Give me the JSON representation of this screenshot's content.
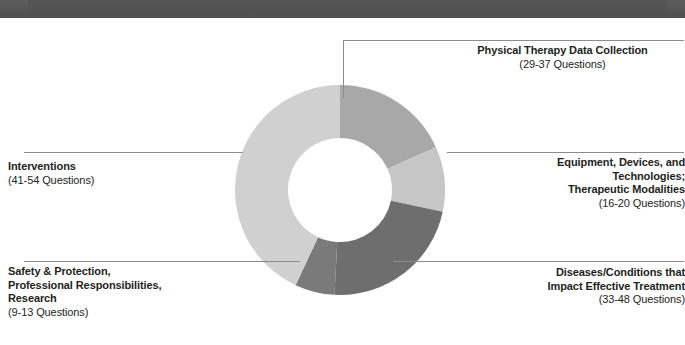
{
  "header": {
    "strip_color": "#555555"
  },
  "chart_data": {
    "type": "pie",
    "variant": "donut",
    "title": "",
    "center": {
      "x": 340,
      "y": 190
    },
    "outer_radius": 105,
    "inner_radius": 52,
    "start_angle_deg": 0,
    "direction": "clockwise",
    "units": "Questions",
    "categories": [
      "Physical Therapy Data Collection",
      "Equipment, Devices, and Technologies; Therapeutic Modalities",
      "Diseases/Conditions that Impact Effective Treatment",
      "Safety & Protection, Professional Responsibilities, Research",
      "Interventions"
    ],
    "values": [
      33,
      18,
      40.5,
      11,
      47.5
    ],
    "value_ranges": [
      [
        29,
        37
      ],
      [
        16,
        20
      ],
      [
        33,
        48
      ],
      [
        9,
        13
      ],
      [
        41,
        54
      ]
    ],
    "range_labels": [
      "(29-37 Questions)",
      "(16-20 Questions)",
      "(33-48 Questions)",
      "(9-13 Questions)",
      "(41-54 Questions)"
    ],
    "colors": [
      "#a8a8a8",
      "#c6c6c6",
      "#6e6e6e",
      "#7a7a7a",
      "#d0d0d0"
    ],
    "legend": "callout-labels",
    "grid": false,
    "slices": [
      {
        "name": "physical-therapy-data-collection",
        "label_lines": [
          "Physical Therapy Data Collection"
        ],
        "range_label": "(29-37 Questions)",
        "color": "#a8a8a8",
        "start_deg": 0,
        "end_deg": 66,
        "value": 33
      },
      {
        "name": "equipment-devices-technologies",
        "label_lines": [
          "Equipment, Devices, and",
          "Technologies;",
          "Therapeutic Modalities"
        ],
        "range_label": "(16-20 Questions)",
        "color": "#c6c6c6",
        "start_deg": 66,
        "end_deg": 102,
        "value": 18
      },
      {
        "name": "diseases-conditions",
        "label_lines": [
          "Diseases/Conditions that",
          "Impact Effective Treatment"
        ],
        "range_label": "(33-48 Questions)",
        "color": "#6e6e6e",
        "start_deg": 102,
        "end_deg": 183,
        "value": 40.5
      },
      {
        "name": "safety-protection-research",
        "label_lines": [
          "Safety & Protection,",
          "Professional Responsibilities,",
          "Research"
        ],
        "range_label": "(9-13 Questions)",
        "color": "#7a7a7a",
        "start_deg": 183,
        "end_deg": 205,
        "value": 11
      },
      {
        "name": "interventions",
        "label_lines": [
          "Interventions"
        ],
        "range_label": "(41-54 Questions)",
        "color": "#d0d0d0",
        "start_deg": 205,
        "end_deg": 360,
        "value": 47.5
      }
    ]
  },
  "labels": {
    "physical_therapy": {
      "title": "Physical Therapy Data Collection",
      "range": "(29-37 Questions)"
    },
    "equipment": {
      "line1": "Equipment, Devices, and",
      "line2": "Technologies;",
      "line3": "Therapeutic Modalities",
      "range": "(16-20 Questions)"
    },
    "diseases": {
      "line1": "Diseases/Conditions that",
      "line2": "Impact Effective Treatment",
      "range": "(33-48 Questions)"
    },
    "safety": {
      "line1": "Safety & Protection,",
      "line2": "Professional Responsibilities,",
      "line3": "Research",
      "range": "(9-13 Questions)"
    },
    "interventions": {
      "title": "Interventions",
      "range": "(41-54 Questions)"
    }
  },
  "style": {
    "leader_line_color": "#8c8c8c",
    "text_color": "#231f20",
    "background": "#ffffff"
  }
}
